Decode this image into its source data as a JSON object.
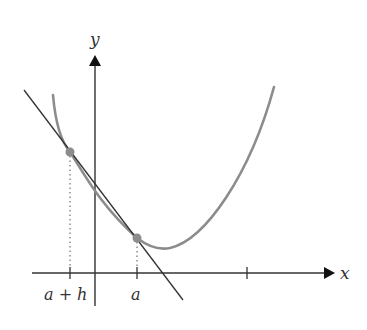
{
  "figure": {
    "axes": {
      "x_label": "x",
      "y_label": "y",
      "x_tick_labels": [
        "a + h",
        "a"
      ]
    },
    "points": [
      {
        "name": "a-plus-h-point",
        "label": "a + h"
      },
      {
        "name": "a-point",
        "label": "a"
      }
    ],
    "colors": {
      "curve": "#8c8c8c",
      "axes": "#333333",
      "secant_line": "#333333",
      "points": "#8c8c8c",
      "dotted_guides": "#555555",
      "background": "#ffffff"
    }
  }
}
